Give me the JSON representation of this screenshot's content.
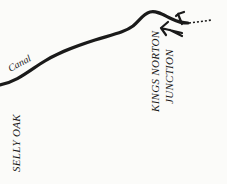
{
  "map": {
    "labels": {
      "canal": "Canal",
      "selly_oak": "SELLY OAK",
      "kings_norton_line1": "KINGS NORTON",
      "kings_norton_line2": "JUNCTION"
    },
    "colors": {
      "background": "#fbfbf9",
      "ink": "#1a1a1a"
    },
    "features": [
      {
        "type": "canal-line",
        "name": "canal"
      },
      {
        "type": "arrow",
        "direction": "up-right"
      },
      {
        "type": "arrow",
        "direction": "left"
      },
      {
        "type": "dotted-line",
        "name": "continuation"
      }
    ]
  }
}
